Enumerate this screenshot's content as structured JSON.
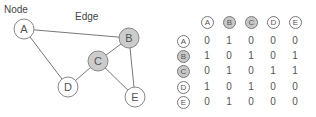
{
  "captions": {
    "node": "Node",
    "edge": "Edge"
  },
  "colors": {
    "node_fill": "#ffffff",
    "node_fill_shaded": "#cccccc",
    "node_stroke": "#888888",
    "edge_stroke": "#777777",
    "text": "#555555"
  },
  "graph": {
    "nodes": [
      {
        "id": "A",
        "label": "A",
        "x": 24,
        "y": 29,
        "shaded": false
      },
      {
        "id": "B",
        "label": "B",
        "x": 129,
        "y": 38,
        "shaded": true
      },
      {
        "id": "C",
        "label": "C",
        "x": 98,
        "y": 61,
        "shaded": true
      },
      {
        "id": "D",
        "label": "D",
        "x": 68,
        "y": 87,
        "shaded": false
      },
      {
        "id": "E",
        "label": "E",
        "x": 135,
        "y": 97,
        "shaded": false
      }
    ],
    "edges": [
      [
        "A",
        "B"
      ],
      [
        "A",
        "D"
      ],
      [
        "B",
        "C"
      ],
      [
        "B",
        "E"
      ],
      [
        "C",
        "D"
      ],
      [
        "C",
        "E"
      ]
    ]
  },
  "matrix": {
    "columns": [
      {
        "label": "A",
        "shaded": false
      },
      {
        "label": "B",
        "shaded": true
      },
      {
        "label": "C",
        "shaded": true
      },
      {
        "label": "D",
        "shaded": false
      },
      {
        "label": "E",
        "shaded": false
      }
    ],
    "rows": [
      {
        "label": "A",
        "shaded": false,
        "values": [
          "0",
          "1",
          "0",
          "0",
          "0"
        ]
      },
      {
        "label": "B",
        "shaded": true,
        "values": [
          "1",
          "0",
          "1",
          "0",
          "1"
        ]
      },
      {
        "label": "C",
        "shaded": true,
        "values": [
          "0",
          "1",
          "0",
          "1",
          "1"
        ]
      },
      {
        "label": "D",
        "shaded": false,
        "values": [
          "1",
          "0",
          "1",
          "0",
          "0"
        ]
      },
      {
        "label": "E",
        "shaded": false,
        "values": [
          "0",
          "1",
          "0",
          "0",
          "0"
        ]
      }
    ]
  }
}
